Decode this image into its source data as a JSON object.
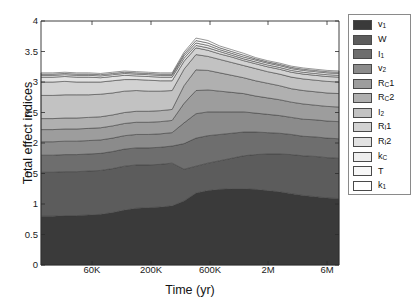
{
  "chart_data": {
    "type": "area",
    "title": "",
    "xlabel": "Time (yr)",
    "ylabel": "Total effect indices",
    "ylim": [
      0,
      4
    ],
    "yticks": [
      "0",
      "0.5",
      "1",
      "1.5",
      "2",
      "2.5",
      "3",
      "3.5",
      "4"
    ],
    "ytick_values": [
      0,
      0.5,
      1,
      1.5,
      2,
      2.5,
      3,
      3.5,
      4
    ],
    "xticks": [
      "60K",
      "200K",
      "600K",
      "2M",
      "6M"
    ],
    "xtick_positions": [
      92,
      151,
      210,
      268,
      327
    ],
    "xscale": "log",
    "grid": false,
    "legend_position": "right-outside",
    "stacked": true,
    "x": [
      1,
      2,
      3,
      4,
      5,
      6,
      7,
      8,
      9,
      10,
      11,
      12,
      13,
      14,
      15,
      16,
      17,
      18,
      19,
      20,
      21,
      22,
      23,
      24,
      25,
      26
    ],
    "series": [
      {
        "name": "v_1",
        "color": "#3a3a3a",
        "values": [
          0.8,
          0.8,
          0.81,
          0.81,
          0.82,
          0.83,
          0.86,
          0.9,
          0.93,
          0.94,
          0.95,
          0.97,
          1.05,
          1.18,
          1.22,
          1.24,
          1.25,
          1.25,
          1.24,
          1.22,
          1.2,
          1.17,
          1.14,
          1.12,
          1.1,
          1.09
        ]
      },
      {
        "name": "W",
        "color": "#5c5c5c",
        "values": [
          0.72,
          0.72,
          0.72,
          0.72,
          0.72,
          0.72,
          0.72,
          0.72,
          0.71,
          0.7,
          0.7,
          0.7,
          0.52,
          0.44,
          0.45,
          0.47,
          0.5,
          0.54,
          0.57,
          0.6,
          0.62,
          0.64,
          0.65,
          0.66,
          0.66,
          0.66
        ]
      },
      {
        "name": "I_1",
        "color": "#6e6e6e",
        "values": [
          0.28,
          0.28,
          0.28,
          0.28,
          0.28,
          0.28,
          0.28,
          0.28,
          0.28,
          0.28,
          0.28,
          0.28,
          0.42,
          0.46,
          0.45,
          0.43,
          0.41,
          0.39,
          0.37,
          0.35,
          0.34,
          0.33,
          0.32,
          0.32,
          0.32,
          0.32
        ]
      },
      {
        "name": "v_2",
        "color": "#8b8b8b",
        "values": [
          0.22,
          0.22,
          0.22,
          0.22,
          0.22,
          0.22,
          0.22,
          0.22,
          0.22,
          0.22,
          0.22,
          0.22,
          0.34,
          0.4,
          0.39,
          0.37,
          0.35,
          0.33,
          0.31,
          0.3,
          0.29,
          0.28,
          0.28,
          0.28,
          0.28,
          0.28
        ]
      },
      {
        "name": "R_C1",
        "color": "#9d9d9d",
        "values": [
          0.2,
          0.2,
          0.2,
          0.2,
          0.2,
          0.2,
          0.2,
          0.2,
          0.2,
          0.2,
          0.2,
          0.2,
          0.32,
          0.38,
          0.36,
          0.34,
          0.32,
          0.3,
          0.28,
          0.27,
          0.26,
          0.25,
          0.25,
          0.24,
          0.24,
          0.24
        ]
      },
      {
        "name": "R_C2",
        "color": "#b0b0b0",
        "values": [
          0.18,
          0.18,
          0.18,
          0.18,
          0.18,
          0.18,
          0.18,
          0.18,
          0.18,
          0.18,
          0.18,
          0.18,
          0.29,
          0.34,
          0.32,
          0.3,
          0.28,
          0.26,
          0.25,
          0.24,
          0.23,
          0.22,
          0.22,
          0.22,
          0.22,
          0.22
        ]
      },
      {
        "name": "I_2",
        "color": "#c2c2c2",
        "values": [
          0.38,
          0.38,
          0.38,
          0.38,
          0.37,
          0.37,
          0.36,
          0.35,
          0.34,
          0.33,
          0.32,
          0.31,
          0.27,
          0.25,
          0.23,
          0.22,
          0.21,
          0.2,
          0.2,
          0.19,
          0.19,
          0.19,
          0.19,
          0.19,
          0.19,
          0.19
        ]
      },
      {
        "name": "R_I1",
        "color": "#d2d2d2",
        "values": [
          0.22,
          0.22,
          0.22,
          0.21,
          0.21,
          0.2,
          0.2,
          0.19,
          0.18,
          0.18,
          0.17,
          0.16,
          0.13,
          0.11,
          0.1,
          0.09,
          0.09,
          0.08,
          0.08,
          0.08,
          0.08,
          0.08,
          0.08,
          0.08,
          0.08,
          0.08
        ]
      },
      {
        "name": "R_I2",
        "color": "#e2e2e2",
        "values": [
          0.08,
          0.08,
          0.08,
          0.08,
          0.08,
          0.07,
          0.07,
          0.07,
          0.06,
          0.06,
          0.06,
          0.06,
          0.05,
          0.04,
          0.04,
          0.04,
          0.03,
          0.03,
          0.03,
          0.03,
          0.03,
          0.03,
          0.03,
          0.03,
          0.03,
          0.03
        ]
      },
      {
        "name": "k_C",
        "color": "#eeeeee",
        "values": [
          0.03,
          0.03,
          0.03,
          0.03,
          0.03,
          0.03,
          0.03,
          0.03,
          0.03,
          0.03,
          0.03,
          0.03,
          0.04,
          0.04,
          0.04,
          0.03,
          0.03,
          0.03,
          0.03,
          0.03,
          0.03,
          0.03,
          0.03,
          0.03,
          0.03,
          0.03
        ]
      },
      {
        "name": "T",
        "color": "#f7f7f7",
        "values": [
          0.02,
          0.02,
          0.02,
          0.02,
          0.02,
          0.02,
          0.02,
          0.02,
          0.02,
          0.02,
          0.02,
          0.02,
          0.03,
          0.04,
          0.04,
          0.03,
          0.03,
          0.03,
          0.02,
          0.02,
          0.02,
          0.02,
          0.02,
          0.02,
          0.02,
          0.02
        ]
      },
      {
        "name": "k_1",
        "color": "#ffffff",
        "values": [
          0.02,
          0.02,
          0.02,
          0.02,
          0.02,
          0.02,
          0.02,
          0.02,
          0.02,
          0.02,
          0.02,
          0.02,
          0.03,
          0.04,
          0.04,
          0.03,
          0.03,
          0.03,
          0.02,
          0.02,
          0.02,
          0.02,
          0.02,
          0.02,
          0.02,
          0.02
        ]
      }
    ]
  },
  "legend": {
    "entries": [
      {
        "label": "v",
        "sub": "1",
        "color": "#3a3a3a"
      },
      {
        "label": "W",
        "sub": "",
        "color": "#5c5c5c"
      },
      {
        "label": "I",
        "sub": "1",
        "color": "#6e6e6e"
      },
      {
        "label": "v",
        "sub": "2",
        "color": "#8b8b8b"
      },
      {
        "label": "R",
        "sub": "C",
        "post": "1",
        "color": "#9d9d9d"
      },
      {
        "label": "R",
        "sub": "C",
        "post": "2",
        "color": "#b0b0b0"
      },
      {
        "label": "I",
        "sub": "2",
        "color": "#c2c2c2"
      },
      {
        "label": "R",
        "sub": "I",
        "post": "1",
        "color": "#d2d2d2"
      },
      {
        "label": "R",
        "sub": "I",
        "post": "2",
        "color": "#e2e2e2"
      },
      {
        "label": "k",
        "sub": "C",
        "color": "#eeeeee"
      },
      {
        "label": "T",
        "sub": "",
        "color": "#f7f7f7"
      },
      {
        "label": "k",
        "sub": "1",
        "color": "#ffffff"
      }
    ]
  },
  "axes": {
    "y_title": "Total effect indices",
    "x_title": "Time (yr)"
  }
}
